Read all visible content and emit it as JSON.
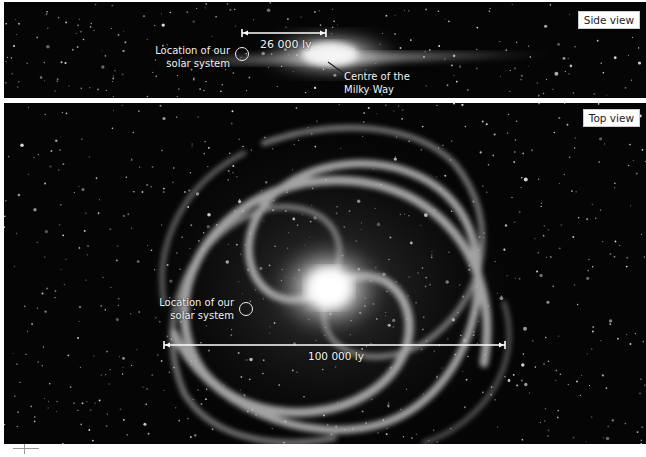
{
  "side_view": {
    "badge": "Side view",
    "solar_label_line1": "Location of our",
    "solar_label_line2": "solar system",
    "distance_label": "26 000 ly",
    "centre_label_line1": "Centre of the",
    "centre_label_line2": "Milky Way"
  },
  "top_view": {
    "badge": "Top view",
    "solar_label_line1": "Location of our",
    "solar_label_line2": "solar system",
    "distance_label": "100 000 ly"
  },
  "colors": {
    "background": "#050505",
    "annotation": "#f2f2f2",
    "badge_bg": "#ffffff"
  }
}
